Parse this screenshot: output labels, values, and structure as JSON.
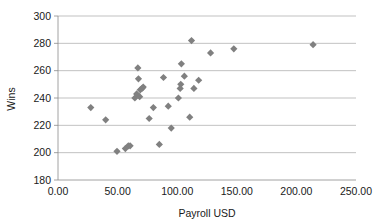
{
  "chart_data": {
    "type": "scatter",
    "title": "",
    "xlabel": "Payroll USD",
    "ylabel": "Wins",
    "xlim": [
      0,
      250
    ],
    "ylim": [
      180,
      300
    ],
    "xticks": [
      0,
      50,
      100,
      150,
      200,
      250
    ],
    "xtick_labels": [
      "0.00",
      "50.00",
      "100.00",
      "150.00",
      "200.00",
      "250.00"
    ],
    "yticks": [
      180,
      200,
      220,
      240,
      260,
      280,
      300
    ],
    "ytick_labels": [
      "180",
      "200",
      "220",
      "240",
      "260",
      "280",
      "300"
    ],
    "grid": "horizontal",
    "legend": "none",
    "marker_shape": "diamond",
    "marker_color": "#808080",
    "series": [
      {
        "name": "Teams",
        "points": [
          [
            27.5,
            233
          ],
          [
            40.0,
            224
          ],
          [
            49.5,
            201
          ],
          [
            56.5,
            203
          ],
          [
            59.0,
            205
          ],
          [
            60.5,
            205
          ],
          [
            64.5,
            240
          ],
          [
            66.0,
            243
          ],
          [
            67.0,
            262
          ],
          [
            67.5,
            254
          ],
          [
            68.5,
            241
          ],
          [
            69.0,
            246
          ],
          [
            70.5,
            247
          ],
          [
            71.5,
            248
          ],
          [
            76.5,
            225
          ],
          [
            80.0,
            233
          ],
          [
            85.0,
            206
          ],
          [
            88.5,
            255
          ],
          [
            92.5,
            234
          ],
          [
            95.0,
            218
          ],
          [
            101.0,
            240
          ],
          [
            102.5,
            247
          ],
          [
            103.0,
            250
          ],
          [
            103.5,
            265
          ],
          [
            106.0,
            256
          ],
          [
            110.5,
            226
          ],
          [
            112.0,
            282
          ],
          [
            114.0,
            247
          ],
          [
            118.0,
            253
          ],
          [
            128.0,
            273
          ],
          [
            147.5,
            276
          ],
          [
            214.0,
            279
          ]
        ]
      }
    ]
  }
}
